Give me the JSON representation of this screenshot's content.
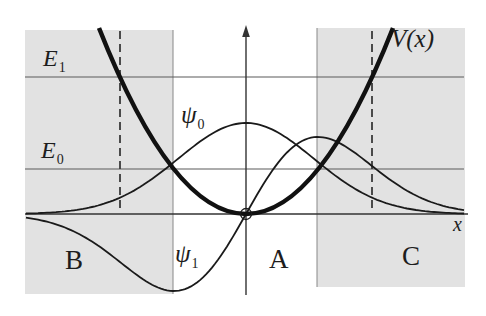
{
  "colors": {
    "background": "#ffffff",
    "shade": "#e2e2e2",
    "shade_edge": "#888888",
    "energy_line": "#5a5a5a",
    "axis": "#333333",
    "dashed": "#3a3a3a",
    "curve": "#1a1a1a",
    "potential_curve": "#111111",
    "text": "#1d1d1d"
  },
  "labels": {
    "potential": "V(x)",
    "x_axis": "x",
    "e1": {
      "base": "E",
      "sub": "1"
    },
    "e0": {
      "base": "E",
      "sub": "0"
    },
    "psi0": {
      "base": "ψ",
      "sub": "0"
    },
    "psi1": {
      "base": "ψ",
      "sub": "1"
    },
    "region_a": "A",
    "region_b": "B",
    "region_c": "C"
  },
  "chart_data": {
    "type": "line",
    "curves": [
      {
        "name": "V(x)",
        "style": "thick parabola, minimum at origin"
      },
      {
        "name": "ψ0",
        "style": "gaussian bump peaked at x=0"
      },
      {
        "name": "ψ1",
        "style": "odd function, trough left of origin, peak right of origin"
      }
    ],
    "energy_levels": [
      "E1",
      "E0"
    ],
    "regions": [
      "B",
      "A",
      "C"
    ],
    "x_axis_label": "x",
    "legend_position": "none",
    "grid": false,
    "geometry": {
      "origin": {
        "x": 246,
        "y": 214
      },
      "parabola": {
        "top_y": 28,
        "half_width": 147,
        "stroke_width": 4.5
      },
      "psi0": {
        "amplitude": 91,
        "sigma": 68,
        "x_min": 26,
        "x_max": 464,
        "stroke_width": 1.8
      },
      "psi1": {
        "amplitude": 77,
        "tau": 72,
        "x_min": 26,
        "x_max": 464,
        "stroke_width": 1.8
      },
      "e1_y": 77,
      "e0_y": 169,
      "energy_line": {
        "x1": 25,
        "x2": 464,
        "stroke_width": 1.1
      },
      "dashed": {
        "xs": [
          120,
          372
        ],
        "y1": 31,
        "y2": 211,
        "pattern": "8 5",
        "stroke_width": 1.8
      },
      "shade_b": {
        "x": 25,
        "y": 30,
        "w": 148,
        "h": 264
      },
      "shade_c": {
        "x": 317,
        "y": 28,
        "w": 148,
        "h": 259
      },
      "x_axis": {
        "x1": 25,
        "x2": 468,
        "y": 214,
        "stroke_width": 1.4
      },
      "y_axis": {
        "x": 246,
        "y1": 31,
        "y2": 295,
        "stroke_width": 1.4
      },
      "arrow": {
        "tip_y": 25,
        "base_y": 37,
        "half_w": 3.8
      },
      "origin_circle_r": 5.5
    }
  }
}
